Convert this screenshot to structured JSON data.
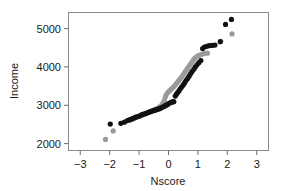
{
  "figure": {
    "background_color": "#ffffff",
    "frame_color": "#8a8a8a",
    "axis_color": "#6e6e6e",
    "text_color": "#1a1a1a"
  },
  "chart_data": {
    "type": "scatter",
    "title": "",
    "subtitle": "",
    "xlabel": "Nscore",
    "ylabel": "Income",
    "xlim": [
      -3.4,
      3.4
    ],
    "ylim": [
      1820,
      5420
    ],
    "xticks": [
      -3,
      -2,
      -1,
      0,
      1,
      2,
      3
    ],
    "xticklabels": [
      "-3",
      "-2",
      "-1",
      "0",
      "1",
      "2",
      "3"
    ],
    "yticks": [
      2000,
      3000,
      4000,
      5000
    ],
    "yticklabels": [
      "2000",
      "3000",
      "4000",
      "5000"
    ],
    "grid": false,
    "legend": false,
    "legend_position": "none",
    "annotations": [],
    "marker": {
      "shape": "circle",
      "radius_px": 2.6,
      "radius_px_gray": 2.6
    },
    "series": [
      {
        "name": "black-series",
        "color": "#111111",
        "points": [
          [
            -1.98,
            2510
          ],
          [
            -1.62,
            2530
          ],
          [
            -1.5,
            2560
          ],
          [
            -1.4,
            2600
          ],
          [
            -1.32,
            2625
          ],
          [
            -1.25,
            2645
          ],
          [
            -1.18,
            2665
          ],
          [
            -1.12,
            2690
          ],
          [
            -1.05,
            2705
          ],
          [
            -0.99,
            2720
          ],
          [
            -0.93,
            2745
          ],
          [
            -0.88,
            2762
          ],
          [
            -0.82,
            2775
          ],
          [
            -0.76,
            2790
          ],
          [
            -0.71,
            2805
          ],
          [
            -0.66,
            2820
          ],
          [
            -0.61,
            2835
          ],
          [
            -0.56,
            2848
          ],
          [
            -0.51,
            2860
          ],
          [
            -0.46,
            2872
          ],
          [
            -0.41,
            2885
          ],
          [
            -0.36,
            2898
          ],
          [
            -0.31,
            2912
          ],
          [
            -0.26,
            2928
          ],
          [
            -0.21,
            2948
          ],
          [
            -0.16,
            2968
          ],
          [
            -0.11,
            2990
          ],
          [
            -0.06,
            3010
          ],
          [
            -0.01,
            3035
          ],
          [
            0.04,
            3058
          ],
          [
            0.09,
            3075
          ],
          [
            0.13,
            3088
          ],
          [
            0.18,
            3095
          ],
          [
            0.23,
            3240
          ],
          [
            0.27,
            3290
          ],
          [
            0.31,
            3330
          ],
          [
            0.36,
            3380
          ],
          [
            0.4,
            3430
          ],
          [
            0.45,
            3480
          ],
          [
            0.5,
            3530
          ],
          [
            0.55,
            3590
          ],
          [
            0.6,
            3650
          ],
          [
            0.65,
            3700
          ],
          [
            0.7,
            3760
          ],
          [
            0.75,
            3820
          ],
          [
            0.8,
            3880
          ],
          [
            0.86,
            3940
          ],
          [
            0.91,
            4000
          ],
          [
            0.97,
            4055
          ],
          [
            1.03,
            4110
          ],
          [
            1.1,
            4165
          ],
          [
            1.16,
            4480
          ],
          [
            1.22,
            4520
          ],
          [
            1.3,
            4540
          ],
          [
            1.38,
            4555
          ],
          [
            1.48,
            4560
          ],
          [
            1.58,
            4570
          ],
          [
            1.76,
            4660
          ],
          [
            1.94,
            5110
          ],
          [
            2.14,
            5240
          ]
        ]
      },
      {
        "name": "gray-series",
        "color": "#9a9a9a",
        "points": [
          [
            -2.14,
            2110
          ],
          [
            -1.88,
            2330
          ],
          [
            -1.3,
            2610
          ],
          [
            -1.18,
            2650
          ],
          [
            -1.08,
            2685
          ],
          [
            -0.98,
            2715
          ],
          [
            -0.9,
            2742
          ],
          [
            -0.82,
            2768
          ],
          [
            -0.75,
            2792
          ],
          [
            -0.68,
            2815
          ],
          [
            -0.61,
            2838
          ],
          [
            -0.55,
            2858
          ],
          [
            -0.49,
            2878
          ],
          [
            -0.43,
            2898
          ],
          [
            -0.37,
            2920
          ],
          [
            -0.32,
            2945
          ],
          [
            -0.27,
            2975
          ],
          [
            -0.22,
            3010
          ],
          [
            -0.18,
            3060
          ],
          [
            -0.14,
            3140
          ],
          [
            -0.1,
            3230
          ],
          [
            -0.06,
            3300
          ],
          [
            -0.01,
            3345
          ],
          [
            0.04,
            3380
          ],
          [
            0.09,
            3415
          ],
          [
            0.14,
            3455
          ],
          [
            0.19,
            3495
          ],
          [
            0.24,
            3540
          ],
          [
            0.29,
            3585
          ],
          [
            0.34,
            3635
          ],
          [
            0.39,
            3685
          ],
          [
            0.44,
            3735
          ],
          [
            0.49,
            3790
          ],
          [
            0.54,
            3845
          ],
          [
            0.59,
            3900
          ],
          [
            0.64,
            3955
          ],
          [
            0.69,
            4010
          ],
          [
            0.74,
            4065
          ],
          [
            0.79,
            4120
          ],
          [
            0.84,
            4175
          ],
          [
            0.89,
            4225
          ],
          [
            0.95,
            4265
          ],
          [
            1.02,
            4295
          ],
          [
            1.1,
            4320
          ],
          [
            1.2,
            4345
          ],
          [
            1.32,
            4360
          ],
          [
            1.78,
            4670
          ],
          [
            2.16,
            4860
          ]
        ]
      }
    ]
  }
}
